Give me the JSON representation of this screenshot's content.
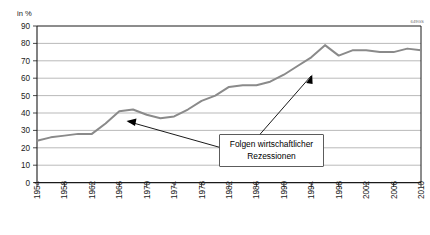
{
  "chart_data": {
    "type": "line",
    "title": "",
    "xlabel": "",
    "ylabel": "in %",
    "ylim": [
      0,
      90
    ],
    "xlim": [
      1954,
      2010
    ],
    "grid": true,
    "legend_position": "none",
    "ytick_labels": [
      "0",
      "10",
      "20",
      "30",
      "40",
      "50",
      "60",
      "70",
      "80",
      "90"
    ],
    "ytick_values": [
      0,
      10,
      20,
      30,
      40,
      50,
      60,
      70,
      80,
      90
    ],
    "xtick_labels": [
      "1954",
      "1958",
      "1962",
      "1966",
      "1970",
      "1974",
      "1978",
      "1982",
      "1986",
      "1990",
      "1994",
      "1998",
      "2002",
      "2006",
      "2010"
    ],
    "xtick_values": [
      1954,
      1958,
      1962,
      1966,
      1970,
      1974,
      1978,
      1982,
      1986,
      1990,
      1994,
      1998,
      2002,
      2006,
      2010
    ],
    "series": [
      {
        "name": "Anteil in Prozent",
        "x": [
          1954,
          1956,
          1958,
          1960,
          1962,
          1964,
          1966,
          1968,
          1970,
          1972,
          1974,
          1976,
          1978,
          1980,
          1982,
          1984,
          1986,
          1988,
          1990,
          1992,
          1994,
          1996,
          1998,
          2000,
          2002,
          2004,
          2006,
          2008,
          2010
        ],
        "values": [
          24,
          26,
          27,
          28,
          28,
          34,
          41,
          42,
          39,
          37,
          38,
          42,
          47,
          50,
          55,
          56,
          56,
          58,
          62,
          67,
          72,
          79,
          73,
          76,
          76,
          75,
          75,
          77,
          76
        ]
      }
    ],
    "annotations": [
      {
        "text_line1": "Folgen wirtschaftlicher",
        "text_line2": "Rezessionen",
        "points_to": [
          1968,
          2000
        ]
      }
    ],
    "corner_code": "649GS"
  },
  "annotation": {
    "line1": "Folgen wirtschaftlicher",
    "line2": "Rezessionen"
  },
  "axis": {
    "y_unit": "in %"
  },
  "corner": {
    "code": "649GS"
  }
}
